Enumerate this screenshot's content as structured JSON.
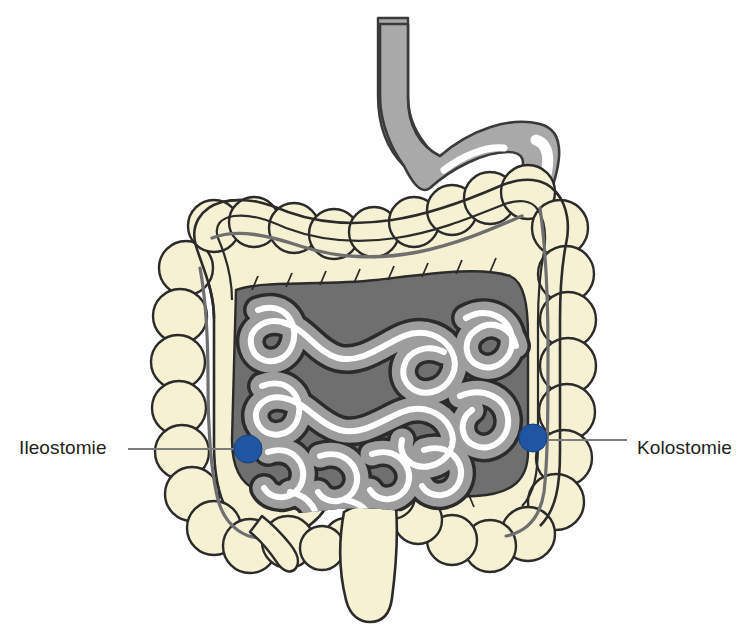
{
  "figure": {
    "background_color": "#fefefe",
    "width": 751,
    "height": 635
  },
  "labels": {
    "left": {
      "text": "Ileostomie",
      "x": 19,
      "y": 438,
      "leader_line_from_x": 128,
      "leader_line_to_x": 248,
      "leader_line_y": 449
    },
    "right": {
      "text": "Kolostomie",
      "x": 637,
      "y": 438,
      "leader_line_from_x": 546,
      "leader_line_to_x": 627,
      "leader_line_y": 446
    }
  },
  "markers": [
    {
      "name": "ileostomy-site",
      "label": "Ileostomie",
      "cx": 248,
      "cy": 449,
      "r": 14,
      "color": "#1f55a3"
    },
    {
      "name": "colostomy-site",
      "label": "Kolostomie",
      "cx": 533,
      "cy": 438,
      "r": 14,
      "color": "#1f55a3"
    }
  ],
  "organs": [
    {
      "name": "stomach",
      "fill": "#a9a9a9",
      "stroke": "#3a3a3a",
      "highlight": "#ffffff"
    },
    {
      "name": "esophagus",
      "fill": "#a9a9a9",
      "stroke": "#3a3a3a"
    },
    {
      "name": "duodenum",
      "fill": "#a9a9a9",
      "stroke": "#3a3a3a"
    },
    {
      "name": "large-intestine-colon",
      "fill": "#f6f1d2",
      "stroke": "#2b2b2b",
      "taenia_coli": "#6f6f6f"
    },
    {
      "name": "mesentery",
      "fill": "#6f6f6f",
      "stroke": "#2b2b2b"
    },
    {
      "name": "small-intestine",
      "fill": "#9d9d9d",
      "stroke": "#2b2b2b",
      "lumen_highlight": "#ffffff"
    },
    {
      "name": "appendix",
      "fill": "#f6f1d2",
      "stroke": "#2b2b2b"
    },
    {
      "name": "rectum",
      "fill": "#f6f1d2",
      "stroke": "#2b2b2b"
    }
  ],
  "colors": {
    "marker_blue": "#1f55a3",
    "colon_cream": "#f6f1d2",
    "stomach_gray": "#a9a9a9",
    "mesentery_gray": "#6f6f6f",
    "bowel_gray": "#9d9d9d",
    "outline_dark": "#2b2b2b",
    "leader_line": "#7d7d7d",
    "text": "#231f20"
  }
}
